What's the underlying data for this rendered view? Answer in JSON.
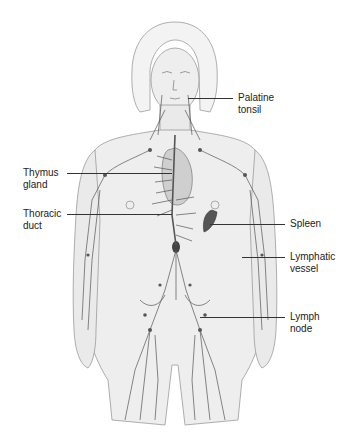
{
  "diagram": {
    "labels": [
      {
        "id": "palatine-tonsil",
        "line1": "Palatine",
        "line2": "tonsil"
      },
      {
        "id": "thymus-gland",
        "line1": "Thymus",
        "line2": "gland"
      },
      {
        "id": "thoracic-duct",
        "line1": "Thoracic",
        "line2": "duct"
      },
      {
        "id": "spleen",
        "line1": "Spleen",
        "line2": ""
      },
      {
        "id": "lymphatic-vessel",
        "line1": "Lymphatic",
        "line2": "vessel"
      },
      {
        "id": "lymph-node",
        "line1": "Lymph",
        "line2": "node"
      }
    ],
    "colors": {
      "background": "#ffffff",
      "body_fill": "#ececec",
      "outline": "#8a8a8a",
      "vessel": "#555555",
      "organ": "#b8b8b8",
      "label_text": "#222222"
    }
  }
}
